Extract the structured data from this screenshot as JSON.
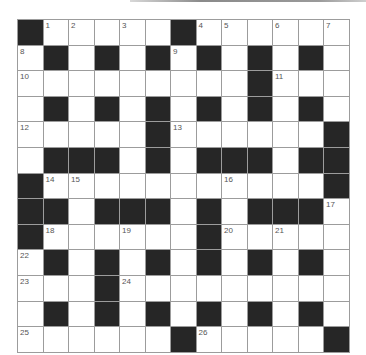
{
  "puzzle": {
    "rows": 13,
    "cols": 13,
    "colors": {
      "block": "#262626",
      "cell": "#ffffff",
      "line": "#9c9c9c",
      "number": "#555555"
    },
    "layout": [
      "#.....#......",
      ".#.#.#.#.#.#.",
      ".........#...",
      ".#.#.#.#.#.#.",
      ".....#......#",
      ".###.#.###.##",
      "#...........#",
      "##.###.#.###.",
      "#......#.....",
      ".#.#.#.#.#.#.",
      "...#.........",
      ".#.#.#.#.#.#.",
      "......#.....#"
    ],
    "numbers": [
      {
        "r": 0,
        "c": 1,
        "n": "1"
      },
      {
        "r": 0,
        "c": 2,
        "n": "2"
      },
      {
        "r": 0,
        "c": 4,
        "n": "3"
      },
      {
        "r": 0,
        "c": 7,
        "n": "4"
      },
      {
        "r": 0,
        "c": 8,
        "n": "5"
      },
      {
        "r": 0,
        "c": 10,
        "n": "6"
      },
      {
        "r": 0,
        "c": 12,
        "n": "7"
      },
      {
        "r": 1,
        "c": 0,
        "n": "8"
      },
      {
        "r": 1,
        "c": 6,
        "n": "9"
      },
      {
        "r": 2,
        "c": 0,
        "n": "10"
      },
      {
        "r": 2,
        "c": 10,
        "n": "11"
      },
      {
        "r": 4,
        "c": 0,
        "n": "12"
      },
      {
        "r": 4,
        "c": 6,
        "n": "13"
      },
      {
        "r": 6,
        "c": 1,
        "n": "14"
      },
      {
        "r": 6,
        "c": 2,
        "n": "15"
      },
      {
        "r": 6,
        "c": 8,
        "n": "16"
      },
      {
        "r": 7,
        "c": 12,
        "n": "17"
      },
      {
        "r": 8,
        "c": 1,
        "n": "18"
      },
      {
        "r": 8,
        "c": 4,
        "n": "19"
      },
      {
        "r": 8,
        "c": 8,
        "n": "20"
      },
      {
        "r": 8,
        "c": 10,
        "n": "21"
      },
      {
        "r": 9,
        "c": 0,
        "n": "22"
      },
      {
        "r": 10,
        "c": 0,
        "n": "23"
      },
      {
        "r": 10,
        "c": 4,
        "n": "24"
      },
      {
        "r": 12,
        "c": 0,
        "n": "25"
      },
      {
        "r": 12,
        "c": 7,
        "n": "26"
      }
    ]
  }
}
